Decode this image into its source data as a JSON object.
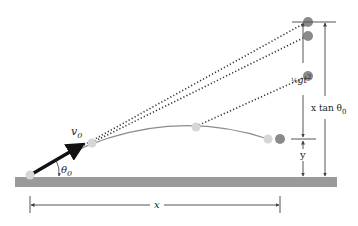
{
  "diagram": {
    "colors": {
      "ground": "#9a9a9a",
      "dark_ball": "#8a8a8a",
      "light_ball": "#d6d6d6",
      "trajectory": "#8c8c8c",
      "dotted": "#333333",
      "arrow": "#111111",
      "dimension": "#555555"
    },
    "labels": {
      "velocity": "v",
      "velocity_sub": "0",
      "angle": "θ",
      "angle_sub": "0",
      "half_g_t2_frac": "½",
      "half_g_t2_text": "gt",
      "half_g_t2_exp": "2",
      "x_tan_theta_x": "x tan θ",
      "x_tan_theta_sub": "0",
      "y": "y",
      "x": "x"
    },
    "light_balls": [
      {
        "cx": 30,
        "cy": 175
      },
      {
        "cx": 92,
        "cy": 143
      },
      {
        "cx": 196,
        "cy": 127
      },
      {
        "cx": 268,
        "cy": 139
      }
    ],
    "dark_balls": [
      {
        "cx": 308,
        "cy": 22
      },
      {
        "cx": 308,
        "cy": 36
      },
      {
        "cx": 308,
        "cy": 76
      },
      {
        "cx": 280,
        "cy": 139
      }
    ]
  }
}
